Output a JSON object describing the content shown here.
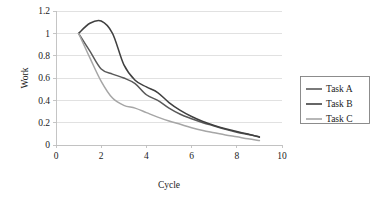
{
  "chart_data": {
    "type": "line",
    "title": "",
    "xlabel": "Cycle",
    "ylabel": "Work",
    "xlim": [
      0,
      10
    ],
    "ylim": [
      0,
      1.2
    ],
    "x_ticks": [
      "0",
      "2",
      "4",
      "6",
      "8",
      "10"
    ],
    "y_ticks": [
      "0",
      "0.2",
      "0.4",
      "0.6",
      "0.8",
      "1",
      "1.2"
    ],
    "grid": "horizontal",
    "legend_position": "right",
    "x": [
      1,
      1.5,
      2,
      2.5,
      3,
      3.5,
      4,
      4.5,
      5,
      5.5,
      6,
      6.5,
      7,
      7.5,
      8,
      8.5,
      9
    ],
    "series": [
      {
        "name": "Task A",
        "color": "#595959",
        "values": [
          1.0,
          0.84,
          0.68,
          0.635,
          0.6,
          0.55,
          0.45,
          0.4,
          0.33,
          0.275,
          0.235,
          0.2,
          0.17,
          0.14,
          0.115,
          0.095,
          0.075
        ]
      },
      {
        "name": "Task B",
        "color": "#404040",
        "values": [
          1.0,
          1.09,
          1.11,
          1.0,
          0.72,
          0.58,
          0.52,
          0.47,
          0.38,
          0.31,
          0.255,
          0.21,
          0.175,
          0.145,
          0.12,
          0.098,
          0.07
        ]
      },
      {
        "name": "Task C",
        "color": "#a6a6a6",
        "values": [
          1.0,
          0.78,
          0.57,
          0.42,
          0.355,
          0.33,
          0.29,
          0.25,
          0.215,
          0.185,
          0.155,
          0.13,
          0.11,
          0.09,
          0.073,
          0.055,
          0.04
        ]
      }
    ]
  },
  "legend": {
    "items": [
      {
        "label": "Task A"
      },
      {
        "label": "Task B"
      },
      {
        "label": "Task C"
      }
    ]
  },
  "axes": {
    "y_title": "Work",
    "x_title": "Cycle"
  }
}
